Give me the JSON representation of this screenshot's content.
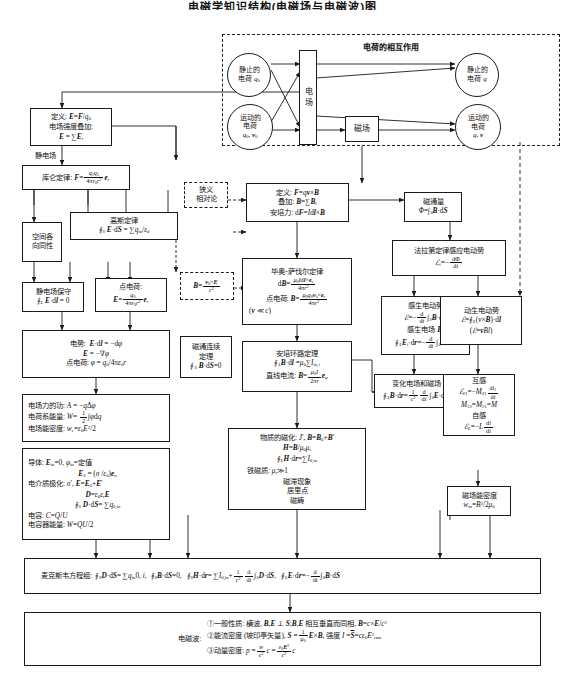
{
  "title": "电磁学知识结构(电磁场与电磁波)图",
  "colors": {
    "line": "#1a1a1a",
    "bg": "#ffffff"
  },
  "top_group": {
    "header": "电荷的相互作用",
    "nodes": {
      "static_charge_q0": "静止的电荷 q₀",
      "static_charge_q": "静止的电荷 q",
      "moving_charge_q0v0": "运动的电荷 q₀, v₀",
      "moving_charge_qv": "运动的电荷 q, v",
      "field": "电场",
      "magnetic_field": "磁场"
    }
  },
  "left_column": {
    "def_field": {
      "l1": "定义: E=F/q₀",
      "l2": "电场强度叠加:",
      "l3": "E = ∑Eᵢ"
    },
    "electrostatic_label": "静电场",
    "coulomb": {
      "l1": "库仑定律: F = q₁q₂/(4πε₀r²) eᵣ"
    },
    "isotropy": {
      "l1": "空间各",
      "l2": "向同性"
    },
    "gauss": {
      "l1": "高斯定律",
      "l2": "∮S E·dS = ∑q_in/ε₀"
    },
    "conservative": {
      "l1": "静电场保守",
      "l2": "∮L E·dl = 0"
    },
    "point_charge": {
      "l1": "点电荷:",
      "l2": "E = q₀/(4πε₀r²) eᵣ"
    },
    "potential": {
      "l1": "电势: E·dl = −dφ",
      "l2": "E = −∇φ",
      "l3": "点电荷: φ = q₀/4πε₀r"
    },
    "work_energy": {
      "l1": "电场力的功: A = −qΔφ",
      "l2": "电荷系能量: W = ½∫φdq",
      "l3": "电场能密度: w_e = ε₀E²/2"
    },
    "conductor": {
      "l1": "导体: E_in = 0, φ_in = 定值",
      "l2": "E_S = (σ/ε₀)e_n",
      "l3": "电介质极化: σ′, E = E₀ + E′",
      "l4": "D = ε₀ε_r E",
      "l5": "∮S D·dS = ∑q₀,in",
      "l6": "电容: C = Q/U",
      "l7": "电容器能量: W = QU/2"
    }
  },
  "middle_column": {
    "special_relativity": {
      "l1": "狭义",
      "l2": "相对论"
    },
    "b_transform": {
      "l1": "B = (v₀ × E)/c²"
    },
    "lorentz": {
      "l1": "定义: F = qv × B",
      "l2": "叠加: B = ∑Bᵢ",
      "l3": "安培力: dF = Idl × B"
    },
    "biot_savart": {
      "l1": "毕奥-萨伐尔定律",
      "l2": "dB = μ₀Idl × eᵣ / 4πr²",
      "l3": "点电荷: B = μ₀q₀v₀ × eᵣ / 4πr²",
      "l4": "(v ≪ c)"
    },
    "flux_continuity": {
      "l1": "磁通连续",
      "l2": "定理",
      "l3": "∮S B·dS = 0"
    },
    "ampere_loop": {
      "l1": "安培环路定理",
      "l2": "∮L B·dl = μ₀∑I_in,i",
      "l3": "直线电流: B = μ₀I/2πr e_φ"
    },
    "magnetization": {
      "l1": "物质的磁化: J′, B = B₀ + B′",
      "l2": "H = B/μ₀μ_r",
      "l3": "∮L H·dr = ∑I₀,in",
      "l4": "铁磁质: μ_r ≫ 1",
      "l5": "磁滞现象",
      "l6": "居里点",
      "l7": "磁畴"
    }
  },
  "right_column": {
    "magnetic_flux": {
      "l1": "磁通量",
      "l2": "Φ = ∫S B·dS"
    },
    "faraday": {
      "l1": "法拉第定律感应电动势",
      "l2": "ℰᵢ = −dΦ/dt"
    },
    "induced_emf": {
      "l1": "感生电动势",
      "l2": "ℰ = −d/dt ∫S B·dS",
      "l3": "感生电场 Eᵢ",
      "l4": "∮L Eᵢ·dr = −d/dt ∫S B·dS"
    },
    "motional_emf": {
      "l1": "动生电动势",
      "l2": "ℰ = ∮L(v × B)·dl",
      "l3": "(ℰ = vBl)"
    },
    "varying_fields": {
      "l1": "变化电场和磁场",
      "l2": "∮L B·dr = (1/c²) d/dt ∫S E·dS"
    },
    "inductance": {
      "l1": "互感",
      "l2": "ℰ₂₁ = −M₂₁ di₁/dt",
      "l3": "M₁₂ = M₂₁ = M",
      "l4": "自感",
      "l5": "ℰ_L = −L di/dt"
    },
    "magnetic_energy": {
      "l1": "磁场能密度",
      "l2": "w_m = B²/2μ₀"
    }
  },
  "maxwell": {
    "label": "麦克斯韦方程组:",
    "eq1": "∮S D·dS = ∑q_in 0, i,",
    "eq2": "∮S B·dS = 0,",
    "eq3": "∮S H·dr = ∑I₀,in + (1/c²) d/dt ∫S D·dS,",
    "eq4": "∮L E·dr = −d/dt ∫S B·dS"
  },
  "em_wave": {
    "label": "电磁波:",
    "item1": "①一般性质: 横波, B,E ⊥ S; B,E 相互垂直而同相, B = c × E/c²",
    "item2": "②能流密度 (坡印亭矢量), S = (1/μ₀) E × B, 强度 I = S̄ = cε₀E²rms",
    "item3": "③动量密度: p = (w/c²)c = (ε₀E²/c²)c"
  }
}
